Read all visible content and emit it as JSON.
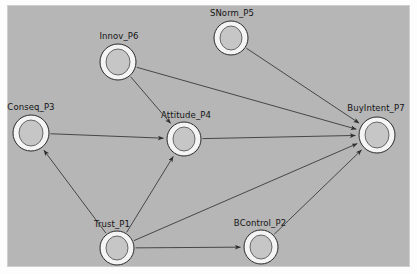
{
  "diagram": {
    "canvas": {
      "background_color": "#b6b6b6",
      "frame_color": "#cfcfcf",
      "outer_background": "#fdfdfd"
    },
    "style": {
      "node_fill": "#cfcfcf",
      "node_inner_fill": "#c6c6c6",
      "node_stroke": "#ffffff",
      "node_outline": "#1a1a1a",
      "edge_color": "#3a3a3a",
      "label_color": "#141414"
    },
    "nodes": [
      {
        "id": "P3",
        "label": "Conseq_P3",
        "x": 31,
        "y": 133,
        "rx": 18,
        "ry": 18,
        "label_x": 31,
        "label_y": 102
      },
      {
        "id": "P6",
        "label": "Innov_P6",
        "x": 118,
        "y": 62,
        "rx": 18,
        "ry": 18,
        "label_x": 119,
        "label_y": 31
      },
      {
        "id": "P5",
        "label": "SNorm_P5",
        "x": 231,
        "y": 38,
        "rx": 17,
        "ry": 17,
        "label_x": 232,
        "label_y": 8
      },
      {
        "id": "P4",
        "label": "Attitude_P4",
        "x": 184,
        "y": 139,
        "rx": 17,
        "ry": 17,
        "label_x": 186,
        "label_y": 110
      },
      {
        "id": "P7",
        "label": "BuyIntent_P7",
        "x": 377,
        "y": 135,
        "rx": 18,
        "ry": 18,
        "label_x": 376,
        "label_y": 103
      },
      {
        "id": "P1",
        "label": "Trust_P1",
        "x": 117,
        "y": 248,
        "rx": 17,
        "ry": 17,
        "label_x": 112,
        "label_y": 219
      },
      {
        "id": "P2",
        "label": "BControl_P2",
        "x": 261,
        "y": 247,
        "rx": 17,
        "ry": 17,
        "label_x": 260,
        "label_y": 218
      }
    ],
    "edges": [
      {
        "from": "P6",
        "to": "P4",
        "name": "innov-to-attitude"
      },
      {
        "from": "P6",
        "to": "P7",
        "name": "innov-to-buyintent"
      },
      {
        "from": "P5",
        "to": "P7",
        "name": "snorm-to-buyintent"
      },
      {
        "from": "P3",
        "to": "P4",
        "name": "conseq-to-attitude"
      },
      {
        "from": "P4",
        "to": "P7",
        "name": "attitude-to-buyintent"
      },
      {
        "from": "P1",
        "to": "P3",
        "name": "trust-to-conseq"
      },
      {
        "from": "P1",
        "to": "P4",
        "name": "trust-to-attitude"
      },
      {
        "from": "P1",
        "to": "P7",
        "name": "trust-to-buyintent"
      },
      {
        "from": "P1",
        "to": "P2",
        "name": "trust-to-bcontrol"
      },
      {
        "from": "P2",
        "to": "P7",
        "name": "bcontrol-to-buyintent"
      }
    ]
  }
}
